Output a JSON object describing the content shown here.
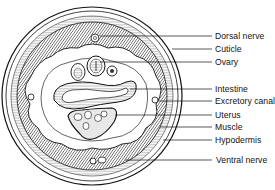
{
  "diagram": {
    "labels": [
      {
        "id": "dorsal-nerve",
        "text": "Dorsal nerve",
        "x": 215,
        "y": 31,
        "line_from": [
          100,
          36
        ],
        "line_to": [
          212,
          36
        ]
      },
      {
        "id": "cuticle",
        "text": "Cuticle",
        "x": 215,
        "y": 44,
        "line_from": [
          172,
          49
        ],
        "line_to": [
          212,
          49
        ]
      },
      {
        "id": "ovary",
        "text": "Ovary",
        "x": 215,
        "y": 57,
        "line_from": [
          100,
          62
        ],
        "line_to": [
          212,
          62
        ]
      },
      {
        "id": "intestine",
        "text": "Intestine",
        "x": 215,
        "y": 84,
        "line_from": [
          130,
          89
        ],
        "line_to": [
          212,
          89
        ]
      },
      {
        "id": "excretory-canal",
        "text": "Excretory canal",
        "x": 215,
        "y": 97,
        "line_from": [
          158,
          101
        ],
        "line_to": [
          212,
          101
        ]
      },
      {
        "id": "uterus",
        "text": "Uterus",
        "x": 215,
        "y": 110,
        "line_from": [
          115,
          115
        ],
        "line_to": [
          212,
          115
        ]
      },
      {
        "id": "muscle",
        "text": "Muscle",
        "x": 215,
        "y": 122,
        "line_from": [
          160,
          127
        ],
        "line_to": [
          212,
          127
        ]
      },
      {
        "id": "hypodermis",
        "text": "Hypodermis",
        "x": 215,
        "y": 135,
        "line_from": [
          163,
          140
        ],
        "line_to": [
          212,
          140
        ]
      },
      {
        "id": "ventral-nerve",
        "text": "Ventral nerve",
        "x": 216,
        "y": 155,
        "line_from": [
          125,
          160
        ],
        "line_to": [
          212,
          160
        ]
      }
    ]
  }
}
